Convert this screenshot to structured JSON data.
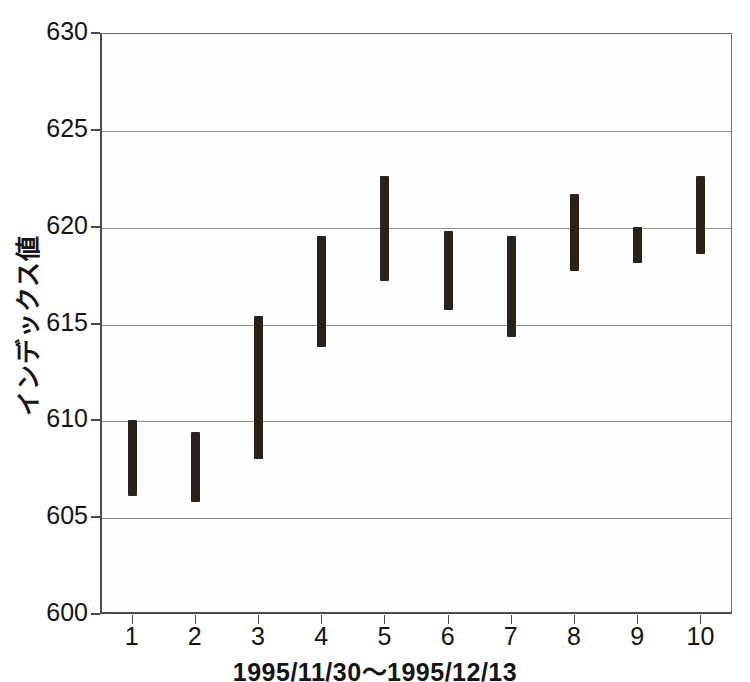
{
  "chart_data": {
    "type": "bar",
    "title": "",
    "subtitle": "",
    "xlabel": "1995/11/30～1995/12/13",
    "ylabel": "インデックス値",
    "categories": [
      "1",
      "2",
      "3",
      "4",
      "5",
      "6",
      "7",
      "8",
      "9",
      "10"
    ],
    "series": [
      {
        "name": "high",
        "values": [
          610.0,
          609.4,
          615.4,
          619.5,
          622.6,
          619.8,
          619.5,
          621.7,
          620.0,
          622.6
        ]
      },
      {
        "name": "low",
        "values": [
          606.1,
          605.8,
          608.0,
          613.8,
          617.2,
          615.7,
          614.3,
          617.7,
          618.1,
          618.6
        ]
      }
    ],
    "bars": [
      {
        "category": "1",
        "high": 610.0,
        "low": 606.1
      },
      {
        "category": "2",
        "high": 609.4,
        "low": 605.8
      },
      {
        "category": "3",
        "high": 615.4,
        "low": 608.0
      },
      {
        "category": "4",
        "high": 619.5,
        "low": 613.8
      },
      {
        "category": "5",
        "high": 622.6,
        "low": 617.2
      },
      {
        "category": "6",
        "high": 619.8,
        "low": 615.7
      },
      {
        "category": "7",
        "high": 619.5,
        "low": 614.3
      },
      {
        "category": "8",
        "high": 621.7,
        "low": 617.7
      },
      {
        "category": "9",
        "high": 620.0,
        "low": 618.1
      },
      {
        "category": "10",
        "high": 622.6,
        "low": 618.6
      }
    ],
    "ylim": [
      600,
      630
    ],
    "yticks": [
      600,
      605,
      610,
      615,
      620,
      625,
      630
    ],
    "ytick_labels": [
      "600",
      "605",
      "610",
      "615",
      "620",
      "625",
      "630"
    ],
    "xlim": [
      0.5,
      10.5
    ],
    "grid": true,
    "legend": false,
    "colors": {
      "bar": "#2a2119",
      "axis": "#4b4b44",
      "grid": "#93938a",
      "background": "#ffffff",
      "text": "#141414"
    }
  }
}
